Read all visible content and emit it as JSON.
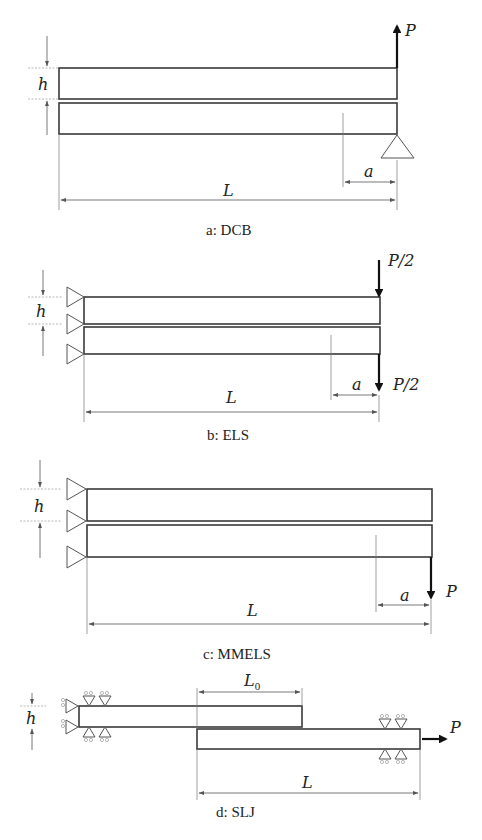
{
  "figure": {
    "panels": [
      {
        "id": "a",
        "caption": "a: DCB",
        "labels": {
          "h": "h",
          "a": "a",
          "L": "L",
          "load": "P"
        }
      },
      {
        "id": "b",
        "caption": "b: ELS",
        "labels": {
          "h": "h",
          "a": "a",
          "L": "L",
          "load_top": "P/2",
          "load_bottom": "P/2"
        }
      },
      {
        "id": "c",
        "caption": "c: MMELS",
        "labels": {
          "h": "h",
          "a": "a",
          "L": "L",
          "load": "P"
        }
      },
      {
        "id": "d",
        "caption": "d: SLJ",
        "labels": {
          "h": "h",
          "L0_main": "L",
          "L0_sub": "0",
          "L": "L",
          "load": "P"
        }
      }
    ]
  }
}
